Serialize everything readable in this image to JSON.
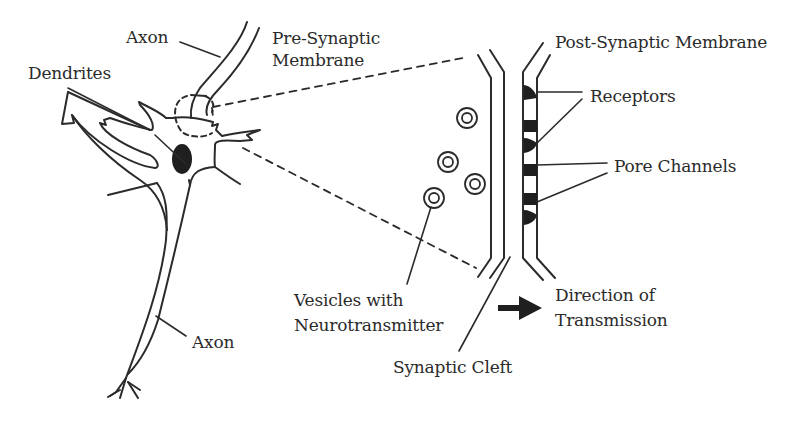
{
  "diagram": {
    "colors": {
      "stroke": "#2b2b2b",
      "fill": "#1f1f1f",
      "background": "#ffffff"
    },
    "labels": {
      "axon_top": "Axon",
      "dendrites": "Dendrites",
      "pre_synaptic_1": "Pre-Synaptic",
      "pre_synaptic_2": "Membrane",
      "post_synaptic": "Post-Synaptic Membrane",
      "receptors": "Receptors",
      "pore_channels": "Pore Channels",
      "vesicles_1": "Vesicles with",
      "vesicles_2": "Neurotransmitter",
      "direction_1": "Direction of",
      "direction_2": "Transmission",
      "synaptic_cleft": "Synaptic Cleft",
      "axon_bottom": "Axon"
    },
    "nodes": [
      "neuron-cell-body",
      "nucleus",
      "dendrites",
      "axon",
      "axon-terminal",
      "pre-synaptic-membrane",
      "post-synaptic-membrane",
      "synaptic-cleft",
      "vesicles",
      "receptors",
      "pore-channels",
      "direction-arrow"
    ],
    "vesicle_count": 4,
    "receptor_count": 3,
    "pore_channel_count": 3
  }
}
